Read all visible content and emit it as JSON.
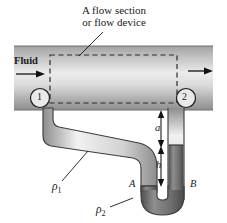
{
  "figure": {
    "title_line1": "A flow section",
    "title_line2": "or flow device",
    "inlet_label": "Fluid",
    "station_1": "1",
    "station_2": "2",
    "density_1": "ρ",
    "density_1_sub": "1",
    "density_2": "ρ",
    "density_2_sub": "2",
    "dim_a": "a",
    "dim_h": "h",
    "point_a": "A",
    "point_b": "B",
    "icons": {
      "inlet_arrow": "arrow-right-icon",
      "outlet_arrow": "arrow-right-icon",
      "leader_line": "leader-line-icon",
      "dimension_arrows": "double-arrow-vertical-icon"
    },
    "colors": {
      "pipe_dark": "#9a9a9a",
      "pipe_light": "#e8e8e8",
      "tube_outline": "#4a4a4a",
      "tube_fill": "#d9d9d9",
      "manometer_fluid": "#6e6e6e",
      "ink": "#1a1a1a",
      "dashed_box": "#2b2b2b"
    }
  }
}
